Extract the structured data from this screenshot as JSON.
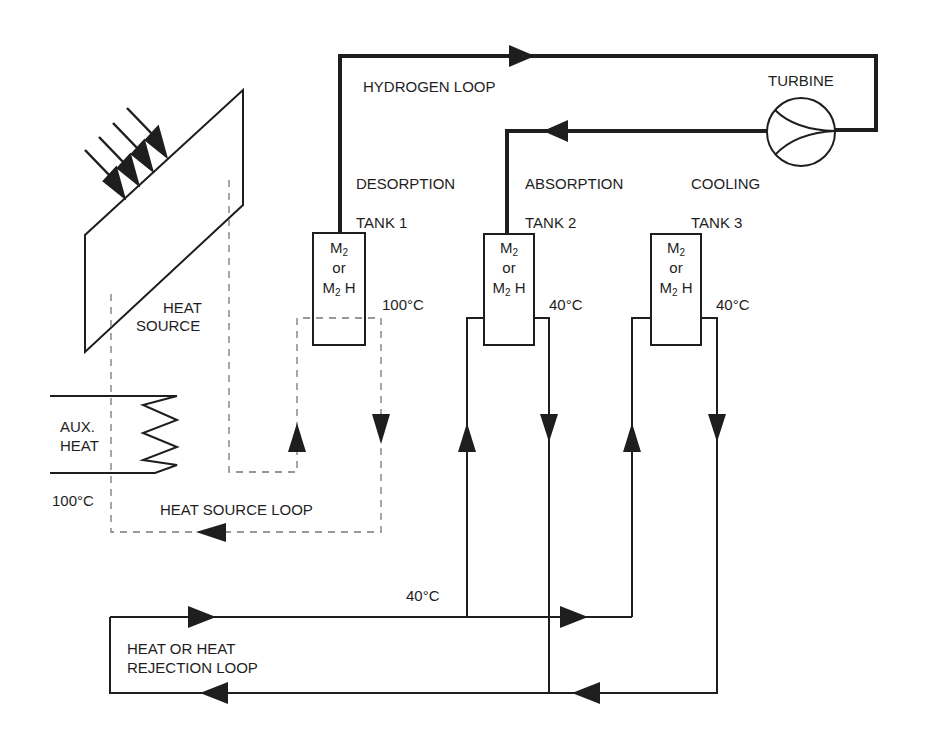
{
  "diagram": {
    "loops": {
      "hydrogen": "HYDROGEN LOOP",
      "heat_source": "HEAT SOURCE LOOP",
      "heat_rejection_line1": "HEAT OR HEAT",
      "heat_rejection_line2": "REJECTION LOOP"
    },
    "components": {
      "turbine": "TURBINE",
      "heat_source_line1": "HEAT",
      "heat_source_line2": "SOURCE",
      "aux_heat_line1": "AUX.",
      "aux_heat_line2": "HEAT"
    },
    "stages": [
      {
        "stage": "DESORPTION",
        "tank": "TANK 1",
        "temperature": "100°C"
      },
      {
        "stage": "ABSORPTION",
        "tank": "TANK 2",
        "temperature": "40°C"
      },
      {
        "stage": "COOLING",
        "tank": "TANK 3",
        "temperature": "40°C"
      }
    ],
    "tank_contents": {
      "metal": "M",
      "metal_sub": "2",
      "or": "or",
      "hydride": "M",
      "hydride_sub": "2",
      "hydride_suffix": " H"
    },
    "temperatures": {
      "aux_heat": "100°C",
      "rejection_supply": "40°C"
    },
    "colors": {
      "line": "#1e1e1e",
      "dashed": "#777777",
      "background": "#ffffff"
    }
  }
}
